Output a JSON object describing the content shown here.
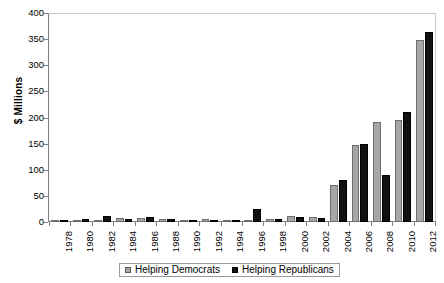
{
  "chart_data": {
    "type": "bar",
    "title": "",
    "xlabel": "",
    "ylabel": "$ Millions",
    "ylim": [
      0,
      400
    ],
    "yticks": [
      0,
      50,
      100,
      150,
      200,
      250,
      300,
      350,
      400
    ],
    "ytick_labels": [
      "0",
      "50",
      "100",
      "150",
      "200",
      "250",
      "300",
      "350",
      "400"
    ],
    "grid": false,
    "legend_position": "bottom",
    "categories": [
      "1978",
      "1980",
      "1982",
      "1984",
      "1986",
      "1988",
      "1990",
      "1992",
      "1994",
      "1996",
      "1998",
      "2000",
      "2002",
      "2004",
      "2006",
      "2008",
      "2010",
      "2012"
    ],
    "series": [
      {
        "name": "Helping Democrats",
        "color": "#a6a6a6",
        "values": [
          1,
          3,
          4,
          7,
          8,
          5,
          3,
          5,
          3,
          4,
          6,
          12,
          9,
          71,
          148,
          192,
          195,
          348
        ]
      },
      {
        "name": "Helping Republicans",
        "color": "#111111",
        "values": [
          1,
          5,
          11,
          6,
          10,
          6,
          4,
          4,
          3,
          25,
          6,
          10,
          8,
          80,
          150,
          90,
          210,
          363
        ]
      }
    ]
  },
  "legend": {
    "entries": [
      {
        "label": "Helping Democrats"
      },
      {
        "label": "Helping Republicans"
      }
    ]
  }
}
